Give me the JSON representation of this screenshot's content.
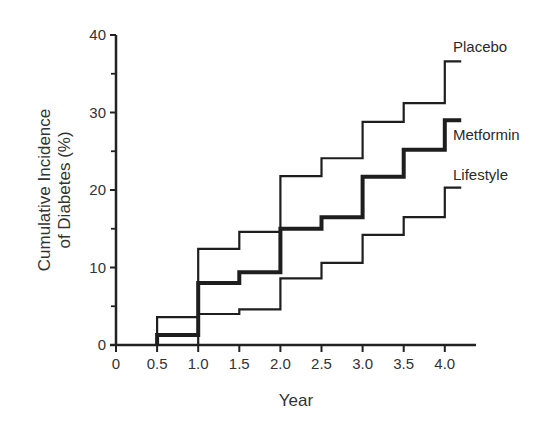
{
  "chart_data": {
    "type": "line",
    "step": true,
    "title": "",
    "xlabel": "Year",
    "ylabel": "Cumulative Incidence of Diabetes (%)",
    "ylabel_lines": [
      "Cumulative Incidence",
      "of Diabetes (%)"
    ],
    "xlim": [
      0,
      4.3
    ],
    "ylim": [
      0,
      40
    ],
    "x_ticks": [
      0,
      0.5,
      1.0,
      1.5,
      2.0,
      2.5,
      3.0,
      3.5,
      4.0
    ],
    "x_tick_labels": [
      "0",
      "0.5",
      "1.0",
      "1.5",
      "2.0",
      "2.5",
      "3.0",
      "3.5",
      "4.0"
    ],
    "y_ticks": [
      0,
      10,
      20,
      30,
      40
    ],
    "y_tick_labels": [
      "0",
      "10",
      "20",
      "30",
      "40"
    ],
    "y_minor_ticks": [
      5,
      15,
      25,
      35
    ],
    "grid": false,
    "legend": "inline labels at line ends (right)",
    "x": [
      0.5,
      1.0,
      1.5,
      2.0,
      2.5,
      3.0,
      3.5,
      4.0
    ],
    "end_x": 4.2,
    "series": [
      {
        "name": "Placebo",
        "values": [
          3.6,
          12.4,
          14.6,
          21.8,
          24.1,
          28.8,
          31.2,
          36.6
        ],
        "stroke_width": 2.2
      },
      {
        "name": "Metformin",
        "values": [
          1.3,
          8.0,
          9.4,
          15.0,
          16.5,
          21.7,
          25.2,
          29.0
        ],
        "stroke_width": 4
      },
      {
        "name": "Lifestyle",
        "values": [
          0,
          4.0,
          4.6,
          8.6,
          10.6,
          14.2,
          16.5,
          20.3
        ],
        "stroke_width": 2.2
      }
    ]
  }
}
